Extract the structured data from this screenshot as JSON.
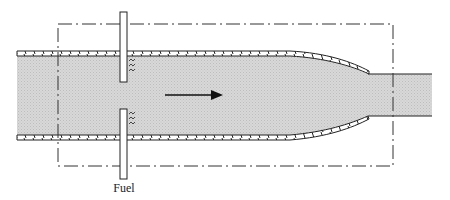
{
  "diagram": {
    "labels": {
      "fuel": "Fuel"
    },
    "elements": {
      "flow_direction": "right",
      "control_volume": "dash-dot rectangle",
      "injectors": 2,
      "duct": "constant-area section converging to smaller outlet"
    },
    "colors": {
      "fluid_fill": "#d6d6d6",
      "line": "#222222",
      "background": "#ffffff"
    }
  }
}
